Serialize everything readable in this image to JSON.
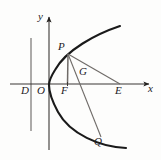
{
  "figure": {
    "kind": "parabola-geometry-diagram",
    "background_color": "#fdfdfc",
    "ink_color": "#23201e",
    "curve_color": "#1a1a1a",
    "line_color": "#55514e",
    "axes": {
      "x_axis_label": "x",
      "y_axis_label": "y",
      "x_axis_y": 84,
      "y_axis_x": 49,
      "x_axis_from": 10,
      "x_axis_to": 152,
      "y_axis_from": 150,
      "y_axis_to": 13
    },
    "directrix": {
      "name": "directrix",
      "x": 31,
      "y_top": 38,
      "y_bottom": 131
    },
    "curve": {
      "name": "parabola",
      "vertex": [
        49,
        84
      ],
      "opens": "right",
      "top_end": [
        120,
        26
      ],
      "bottom_end": [
        126,
        148
      ]
    },
    "points": [
      {
        "id": "D",
        "label": "D",
        "x": 23,
        "y": 90,
        "marker_x": 31,
        "marker_y": 84
      },
      {
        "id": "O",
        "label": "O",
        "x": 38,
        "y": 90,
        "marker_x": 49,
        "marker_y": 84
      },
      {
        "id": "F",
        "label": "F",
        "x": 62,
        "y": 90,
        "marker_x": 67,
        "marker_y": 84
      },
      {
        "id": "G",
        "label": "G",
        "x": 79,
        "y": 72,
        "marker_x": 79,
        "marker_y": 78
      },
      {
        "id": "E",
        "label": "E",
        "x": 116,
        "y": 90,
        "marker_x": 120,
        "marker_y": 84
      },
      {
        "id": "P",
        "label": "P",
        "x": 59,
        "y": 44,
        "marker_x": 68,
        "marker_y": 53
      },
      {
        "id": "Q",
        "label": "Q",
        "x": 95,
        "y": 140,
        "marker_x": 100,
        "marker_y": 136
      }
    ],
    "segments": [
      {
        "id": "PF",
        "from": "P",
        "to": "F",
        "note": "vertical segment from P down to focus F"
      },
      {
        "id": "PE",
        "from": "P",
        "to": "E",
        "note": "segment from P to E on x-axis"
      },
      {
        "id": "PQ",
        "from": "P",
        "to": "Q",
        "note": "focal chord from P through G to Q"
      },
      {
        "id": "GE",
        "from": "G",
        "to": "E",
        "note": "segment along PE through G"
      }
    ],
    "axis_labels": {
      "x": {
        "text": "x",
        "left": 148,
        "top": 85
      },
      "y": {
        "text": "y",
        "left": 38,
        "top": 12
      }
    }
  }
}
